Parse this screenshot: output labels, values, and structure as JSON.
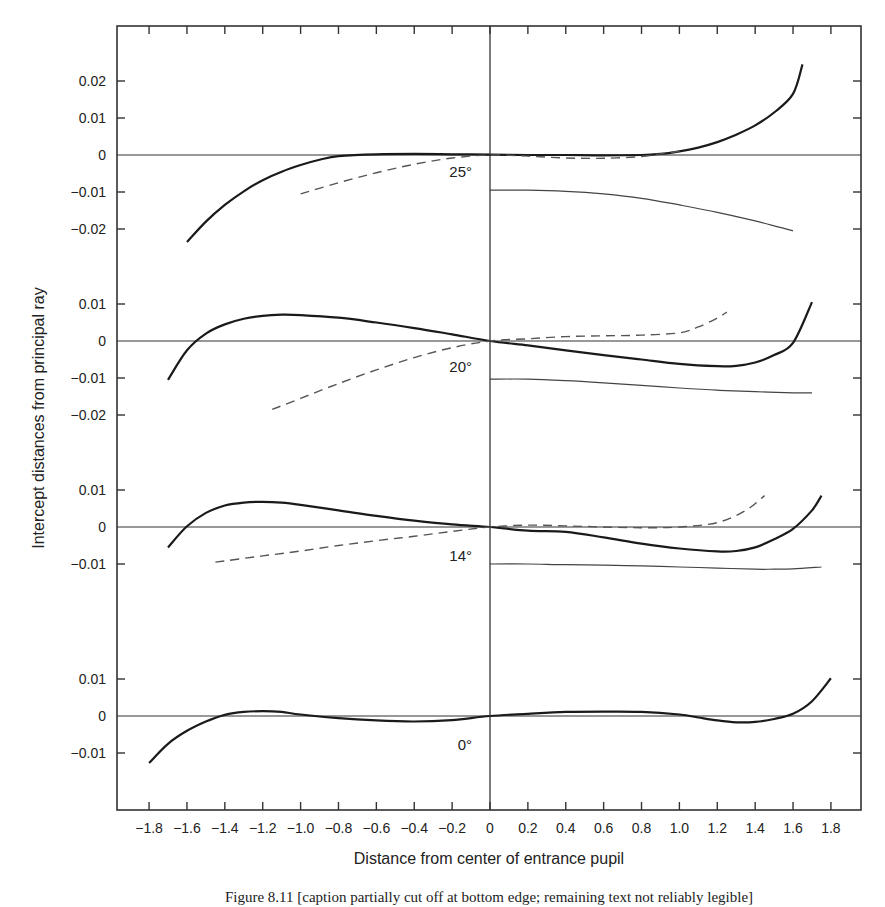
{
  "chart_data": {
    "type": "line",
    "title": "",
    "xlabel": "Distance from center of entrance pupil",
    "ylabel": "Intercept distances from principal ray",
    "xlim": [
      -1.8,
      1.8
    ],
    "x_ticks": [
      "-1.8",
      "-1.6",
      "-1.4",
      "-1.2",
      "-1.0",
      "-0.8",
      "-0.6",
      "-0.4",
      "-0.2",
      "0",
      "0.2",
      "0.4",
      "0.6",
      "0.8",
      "1.0",
      "1.2",
      "1.4",
      "1.6",
      "1.8"
    ],
    "x_tick_labels": [
      "−1.8",
      "−1.6",
      "−1.4",
      "−1.2",
      "−1.0",
      "−0.8",
      "−0.6",
      "−0.4",
      "−0.2",
      "0",
      "0.2",
      "0.4",
      "0.6",
      "0.8",
      "1.0",
      "1.2",
      "1.4",
      "1.6",
      "1.8"
    ],
    "grid": false,
    "legend": "none",
    "line_styles": {
      "meridional": "solid thick",
      "sagittal": "dashed",
      "third": "solid thin (right half only)"
    },
    "panels": [
      {
        "label": "25°",
        "y_ticks": [
          0.02,
          0.01,
          0,
          -0.01,
          -0.02
        ],
        "y_tick_labels": [
          "0.02",
          "0.01",
          "0",
          "−0.01",
          "−0.02"
        ],
        "series": [
          {
            "name": "meridional",
            "style": "solid-thick",
            "x": [
              -1.6,
              -1.5,
              -1.4,
              -1.3,
              -1.2,
              -1.1,
              -1.0,
              -0.9,
              -0.8,
              -0.6,
              -0.4,
              -0.2,
              0,
              0.2,
              0.4,
              0.6,
              0.8,
              0.9,
              1.0,
              1.1,
              1.2,
              1.3,
              1.4,
              1.5,
              1.6,
              1.65
            ],
            "y": [
              -0.0235,
              -0.018,
              -0.0135,
              -0.0098,
              -0.0068,
              -0.0045,
              -0.0027,
              -0.0013,
              -0.0003,
              0.0002,
              0.0003,
              0.0002,
              0.0001,
              0,
              0,
              -0.0001,
              0,
              0.0003,
              0.001,
              0.002,
              0.0035,
              0.0055,
              0.008,
              0.0115,
              0.0165,
              0.0245
            ]
          },
          {
            "name": "sagittal",
            "style": "dashed",
            "x": [
              -1.0,
              -0.8,
              -0.6,
              -0.4,
              -0.2,
              0,
              0.2,
              0.4,
              0.6,
              0.8,
              0.9,
              1.0
            ],
            "y": [
              -0.0105,
              -0.0075,
              -0.0048,
              -0.0025,
              -0.0008,
              0,
              -0.0003,
              -0.0008,
              -0.0009,
              -0.0004,
              0.0003,
              0.001
            ]
          },
          {
            "name": "third",
            "style": "solid-thin",
            "x": [
              0,
              0.2,
              0.4,
              0.6,
              0.8,
              1.0,
              1.2,
              1.4,
              1.6
            ],
            "y": [
              -0.0095,
              -0.0095,
              -0.0098,
              -0.0105,
              -0.0117,
              -0.0135,
              -0.0155,
              -0.0178,
              -0.0205
            ]
          }
        ]
      },
      {
        "label": "20°",
        "y_ticks": [
          0.01,
          0,
          -0.01,
          -0.02
        ],
        "y_tick_labels": [
          "0.01",
          "0",
          "−0.01",
          "−0.02"
        ],
        "series": [
          {
            "name": "meridional",
            "style": "solid-thick",
            "x": [
              -1.7,
              -1.6,
              -1.5,
              -1.4,
              -1.3,
              -1.2,
              -1.1,
              -1.0,
              -0.8,
              -0.6,
              -0.4,
              -0.2,
              0,
              0.2,
              0.4,
              0.6,
              0.8,
              1.0,
              1.2,
              1.3,
              1.4,
              1.5,
              1.6,
              1.7
            ],
            "y": [
              -0.0105,
              -0.0025,
              0.002,
              0.0045,
              0.006,
              0.0068,
              0.0071,
              0.007,
              0.0063,
              0.005,
              0.0035,
              0.0018,
              0,
              -0.0012,
              -0.0025,
              -0.0038,
              -0.005,
              -0.0062,
              -0.0068,
              -0.0067,
              -0.0058,
              -0.0038,
              -0.0005,
              0.0105
            ]
          },
          {
            "name": "sagittal",
            "style": "dashed",
            "x": [
              -1.15,
              -1.0,
              -0.8,
              -0.6,
              -0.4,
              -0.2,
              0,
              0.2,
              0.4,
              0.6,
              0.8,
              1.0,
              1.1,
              1.2,
              1.25
            ],
            "y": [
              -0.0185,
              -0.0155,
              -0.0115,
              -0.0078,
              -0.0045,
              -0.0018,
              0,
              0.0006,
              0.0012,
              0.0014,
              0.0016,
              0.0022,
              0.0038,
              0.0062,
              0.0078
            ]
          },
          {
            "name": "third",
            "style": "solid-thin",
            "x": [
              0,
              0.2,
              0.4,
              0.6,
              0.8,
              1.0,
              1.2,
              1.4,
              1.6,
              1.7
            ],
            "y": [
              -0.0103,
              -0.0103,
              -0.0107,
              -0.0113,
              -0.012,
              -0.0127,
              -0.0133,
              -0.0137,
              -0.014,
              -0.014
            ]
          }
        ]
      },
      {
        "label": "14°",
        "y_ticks": [
          0.01,
          0,
          -0.01
        ],
        "y_tick_labels": [
          "0.01",
          "0",
          "−0.01"
        ],
        "series": [
          {
            "name": "meridional",
            "style": "solid-thick",
            "x": [
              -1.7,
              -1.6,
              -1.5,
              -1.4,
              -1.3,
              -1.2,
              -1.1,
              -1.0,
              -0.8,
              -0.6,
              -0.4,
              -0.2,
              0,
              0.2,
              0.4,
              0.6,
              0.8,
              1.0,
              1.2,
              1.3,
              1.4,
              1.5,
              1.6,
              1.7,
              1.75
            ],
            "y": [
              -0.0055,
              0.0002,
              0.0038,
              0.0058,
              0.0066,
              0.0068,
              0.0066,
              0.006,
              0.0045,
              0.003,
              0.0017,
              0.0007,
              0,
              -0.001,
              -0.0013,
              -0.0028,
              -0.0045,
              -0.0058,
              -0.0066,
              -0.0065,
              -0.0055,
              -0.0033,
              -0.0005,
              0.0045,
              0.0085
            ]
          },
          {
            "name": "sagittal",
            "style": "dashed",
            "x": [
              -1.45,
              -1.2,
              -1.0,
              -0.8,
              -0.6,
              -0.4,
              -0.2,
              0,
              0.2,
              0.4,
              0.6,
              0.8,
              1.0,
              1.2,
              1.35,
              1.45
            ],
            "y": [
              -0.0095,
              -0.0078,
              -0.0065,
              -0.005,
              -0.0037,
              -0.0025,
              -0.0012,
              0,
              0.0005,
              0.0003,
              0,
              -0.0002,
              0,
              0.0012,
              0.0045,
              0.0085
            ]
          },
          {
            "name": "third",
            "style": "solid-thin",
            "x": [
              0,
              0.2,
              0.4,
              0.6,
              0.8,
              1.0,
              1.2,
              1.4,
              1.5,
              1.6,
              1.75
            ],
            "y": [
              -0.01,
              -0.01,
              -0.0102,
              -0.0103,
              -0.0105,
              -0.0108,
              -0.0111,
              -0.0114,
              -0.0114,
              -0.0113,
              -0.0108
            ]
          }
        ]
      },
      {
        "label": "0°",
        "y_ticks": [
          0.01,
          0,
          -0.01
        ],
        "y_tick_labels": [
          "0.01",
          "0",
          "−0.01"
        ],
        "series": [
          {
            "name": "meridional",
            "style": "solid-thick",
            "x": [
              -1.8,
              -1.7,
              -1.6,
              -1.5,
              -1.4,
              -1.3,
              -1.2,
              -1.1,
              -1.0,
              -0.8,
              -0.6,
              -0.4,
              -0.2,
              0,
              0.2,
              0.4,
              0.6,
              0.8,
              1.0,
              1.1,
              1.2,
              1.3,
              1.4,
              1.5,
              1.6,
              1.7,
              1.8
            ],
            "y": [
              -0.0127,
              -0.0075,
              -0.004,
              -0.0015,
              0.0003,
              0.0011,
              0.0013,
              0.0011,
              0.0004,
              -0.0006,
              -0.0012,
              -0.0015,
              -0.0011,
              0,
              0.0006,
              0.0011,
              0.0012,
              0.0011,
              0.0004,
              -0.0004,
              -0.0012,
              -0.0017,
              -0.0016,
              -0.0008,
              0.0006,
              0.004,
              0.0102
            ]
          }
        ]
      }
    ],
    "annotations": [
      "25°",
      "20°",
      "14°",
      "0°"
    ]
  },
  "figure": {
    "x_axis_title": "Distance from center of entrance pupil",
    "y_axis_title": "Intercept distances from principal ray",
    "caption": "Figure 8.11 [caption partially cut off at bottom edge; remaining text not reliably legible]"
  }
}
